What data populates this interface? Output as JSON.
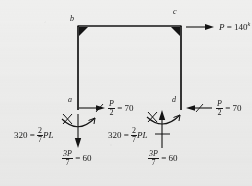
{
  "figure": {
    "type": "structural-free-body-diagram",
    "description": "Portal frame free body diagram with applied load and support reactions",
    "background_color": "#efefee",
    "ink_color": "#141414"
  },
  "nodes": [
    {
      "id": "b",
      "label": "b",
      "x": 72,
      "y": 22,
      "corner": "top-left"
    },
    {
      "id": "c",
      "label": "c",
      "x": 176,
      "y": 18,
      "corner": "top-right"
    },
    {
      "id": "a",
      "label": "a",
      "x": 70,
      "y": 101,
      "corner": "bottom-left"
    },
    {
      "id": "d",
      "label": "d",
      "x": 176,
      "y": 101,
      "corner": "bottom-right"
    }
  ],
  "frame": {
    "left_x": 78,
    "right_x": 181,
    "top_y": 26,
    "bottom_y": 110,
    "stroke_width": 1.6
  },
  "applied_load": {
    "name": "horizontal-load-P",
    "symbol": "P",
    "equals": "=",
    "value": "140",
    "unit_superscript": "k",
    "full_text": "P = 140k",
    "direction": "right",
    "at_node": "c"
  },
  "reactions": [
    {
      "name": "shear-left",
      "at_node": "a",
      "numerator": "P",
      "denominator": "2",
      "equals": "=",
      "value": "70",
      "full_text": "P/2 = 70",
      "direction": "right"
    },
    {
      "name": "shear-right",
      "at_node": "d",
      "numerator": "P",
      "denominator": "2",
      "equals": "=",
      "value": "70",
      "full_text": "P/2 = 70",
      "direction": "left"
    },
    {
      "name": "axial-left",
      "at_node": "a",
      "numerator": "3P",
      "denominator": "7",
      "equals": "=",
      "value": "60",
      "full_text": "3P/7 = 60",
      "direction": "down"
    },
    {
      "name": "axial-right",
      "at_node": "d",
      "numerator": "3P",
      "denominator": "7",
      "equals": "=",
      "value": "60",
      "full_text": "3P/7 = 60",
      "direction": "up"
    }
  ],
  "moments": [
    {
      "name": "moment-left",
      "at_node": "a",
      "value": "320",
      "equals": "=",
      "numerator": "2",
      "denominator": "7",
      "term": "PL",
      "full_text": "320 = 2/7 PL"
    },
    {
      "name": "moment-right",
      "at_node": "d",
      "value": "320",
      "equals": "=",
      "numerator": "2",
      "denominator": "7",
      "term": "PL",
      "full_text": "320 = 2/7 PL"
    }
  ]
}
